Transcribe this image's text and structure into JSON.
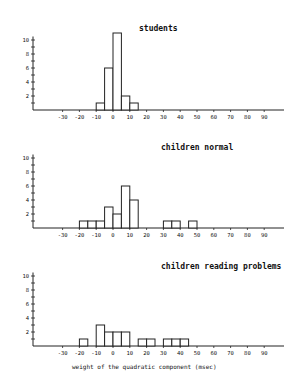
{
  "chart_data": [
    {
      "type": "bar",
      "title": "students",
      "xlabel": "",
      "ylabel": "",
      "bin_width": 5,
      "bins": [
        {
          "from": -10,
          "to": -5,
          "count": 1
        },
        {
          "from": -5,
          "to": 0,
          "count": 6
        },
        {
          "from": 0,
          "to": 5,
          "count": 11
        },
        {
          "from": 5,
          "to": 10,
          "count": 2
        },
        {
          "from": 10,
          "to": 15,
          "count": 1
        }
      ],
      "xticks": [
        -30,
        -20,
        -10,
        0,
        10,
        20,
        30,
        40,
        50,
        60,
        70,
        80,
        90
      ],
      "yticks": [
        2,
        4,
        6,
        8,
        10
      ],
      "ylim": [
        0,
        10.5
      ],
      "xlim": [
        -42,
        100
      ],
      "grid": false,
      "legend": "none"
    },
    {
      "type": "bar",
      "title": "children normal",
      "xlabel": "",
      "ylabel": "",
      "bin_width": 5,
      "bins": [
        {
          "from": -20,
          "to": -15,
          "count": 1
        },
        {
          "from": -15,
          "to": -10,
          "count": 1
        },
        {
          "from": -10,
          "to": -5,
          "count": 1
        },
        {
          "from": -5,
          "to": 0,
          "count": 3
        },
        {
          "from": 0,
          "to": 5,
          "count": 2
        },
        {
          "from": 5,
          "to": 10,
          "count": 6
        },
        {
          "from": 10,
          "to": 15,
          "count": 4
        },
        {
          "from": 30,
          "to": 35,
          "count": 1
        },
        {
          "from": 35,
          "to": 40,
          "count": 1
        },
        {
          "from": 45,
          "to": 50,
          "count": 1
        }
      ],
      "xticks": [
        -30,
        -20,
        -10,
        0,
        10,
        20,
        30,
        40,
        50,
        60,
        70,
        80,
        90
      ],
      "yticks": [
        2,
        4,
        6,
        8,
        10
      ],
      "ylim": [
        0,
        10.5
      ],
      "xlim": [
        -42,
        100
      ],
      "grid": false,
      "legend": "none"
    },
    {
      "type": "bar",
      "title": "children reading problems",
      "xlabel": "weight of the quadratic component (msec)",
      "ylabel": "",
      "bin_width": 5,
      "bins": [
        {
          "from": -20,
          "to": -15,
          "count": 1
        },
        {
          "from": -10,
          "to": -5,
          "count": 3
        },
        {
          "from": -5,
          "to": 0,
          "count": 2
        },
        {
          "from": 0,
          "to": 5,
          "count": 2
        },
        {
          "from": 5,
          "to": 10,
          "count": 2
        },
        {
          "from": 15,
          "to": 20,
          "count": 1
        },
        {
          "from": 20,
          "to": 25,
          "count": 1
        },
        {
          "from": 30,
          "to": 35,
          "count": 1
        },
        {
          "from": 35,
          "to": 40,
          "count": 1
        },
        {
          "from": 40,
          "to": 45,
          "count": 1
        }
      ],
      "xticks": [
        -30,
        -20,
        -10,
        0,
        10,
        20,
        30,
        40,
        50,
        60,
        70,
        80,
        90
      ],
      "yticks": [
        2,
        4,
        6,
        8,
        10
      ],
      "ylim": [
        0,
        10.5
      ],
      "xlim": [
        -42,
        100
      ],
      "grid": false,
      "legend": "none"
    }
  ],
  "panels": [
    {
      "title": "students",
      "top": 0
    },
    {
      "title": "children normal",
      "top": 120
    },
    {
      "title": "children reading problems",
      "top": 240
    }
  ],
  "xlabel": "weight of the quadratic component (msec)"
}
